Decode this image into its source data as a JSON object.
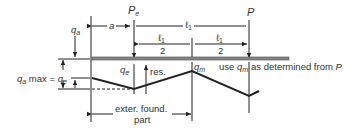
{
  "diagram": {
    "labels": {
      "Pe": "P",
      "Pe_sub": "e",
      "P": "P",
      "a": "a",
      "l1_full": "ℓ",
      "l1_full_sub": "1",
      "l1_half_num_left": "ℓ",
      "l1_half_num_left_sub": "1",
      "l1_half_den_left": "2",
      "l1_half_num_right": "ℓ",
      "l1_half_num_right_sub": "1",
      "l1_half_den_right": "2",
      "qa": "q",
      "qa_sub": "a",
      "qa_max_prefix": "q",
      "qa_max_prefix_sub": "a",
      "qa_max_mid": " max = ",
      "qa_max_q": "q",
      "qa_max_q_sub": "e",
      "qe": "q",
      "qe_sub": "e",
      "res": "res.",
      "qm": "q",
      "qm_sub": "m",
      "use_prefix": "use ",
      "use_q": "q",
      "use_q_sub": "m",
      "use_suffix": " as determined from ",
      "use_P": "P",
      "exter_line1": "exter. found.",
      "exter_line2": "part"
    },
    "colors": {
      "line": "#222222",
      "footing": "#666666",
      "text": "#333333"
    }
  }
}
